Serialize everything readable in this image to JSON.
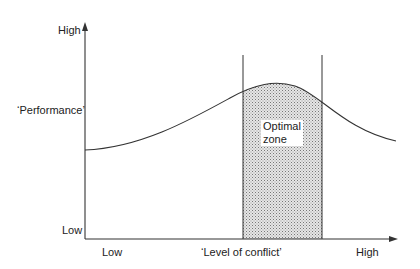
{
  "diagram": {
    "y_axis": {
      "label": "‘Performance’",
      "high_label": "High",
      "low_label": "Low"
    },
    "x_axis": {
      "label": "‘Level of conflict’",
      "low_label": "Low",
      "high_label": "High"
    },
    "zone": {
      "line1": "Optimal",
      "line2": "zone",
      "fill_pattern": "dotted grey"
    },
    "curve": {
      "shape": "inverted-U",
      "description": "Performance rises with level of conflict to a peak in the optimal zone, then declines"
    },
    "colors": {
      "line": "#333333",
      "zone_fill": "#bdbdbd",
      "background": "#ffffff"
    }
  }
}
